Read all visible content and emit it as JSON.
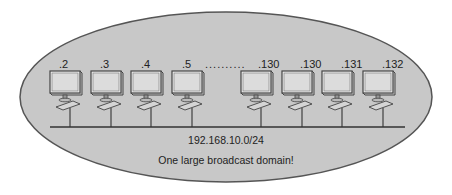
{
  "diagram": {
    "network_label": "192.168.10.0/24",
    "caption": "One large broadcast domain!",
    "ellipsis": "..........",
    "hosts": [
      {
        "label": ".2"
      },
      {
        "label": ".3"
      },
      {
        "label": ".4"
      },
      {
        "label": ".5"
      },
      {
        "label": ".130"
      },
      {
        "label": ".130"
      },
      {
        "label": ".131"
      },
      {
        "label": ".132"
      }
    ],
    "colors": {
      "ellipse_fill": "#c8c8c8",
      "ellipse_stroke": "#555555",
      "screen": "#e6e6e6",
      "line": "#333333"
    }
  }
}
